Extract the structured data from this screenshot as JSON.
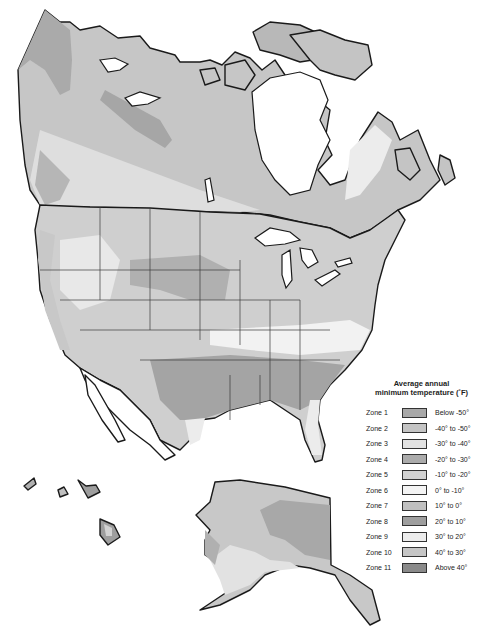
{
  "map": {
    "subject": "Plant hardiness zones of North America",
    "regions_shown": [
      "Canada",
      "United States (contiguous)",
      "Alaska",
      "Hawaii",
      "Northern Mexico"
    ],
    "colors": {
      "zone1": "#a8a8a8",
      "zone2": "#c4c4c4",
      "zone3": "#e2e2e2",
      "zone4": "#ababab",
      "zone5": "#d2d2d2",
      "zone6": "#f2f2f2",
      "zone7": "#c0c0c0",
      "zone8": "#9e9e9e",
      "zone9": "#ececec",
      "zone10": "#c8c8c8",
      "zone11": "#8c8c8c",
      "water": "#ffffff",
      "outline": "#1a1a1a"
    }
  },
  "legend": {
    "title_line1": "Average annual",
    "title_line2": "minimum temperature (˚F)",
    "items": [
      {
        "zone": "Zone 1",
        "range": "Below -50°",
        "color": "#a8a8a8"
      },
      {
        "zone": "Zone 2",
        "range": "-40° to -50°",
        "color": "#c4c4c4"
      },
      {
        "zone": "Zone 3",
        "range": "-30° to -40°",
        "color": "#e2e2e2"
      },
      {
        "zone": "Zone 4",
        "range": "-20° to -30°",
        "color": "#ababab"
      },
      {
        "zone": "Zone 5",
        "range": "-10° to -20°",
        "color": "#d2d2d2"
      },
      {
        "zone": "Zone 6",
        "range": "0° to -10°",
        "color": "#f4f4f4"
      },
      {
        "zone": "Zone 7",
        "range": "10° to 0°",
        "color": "#c0c0c0"
      },
      {
        "zone": "Zone 8",
        "range": "20° to 10°",
        "color": "#9e9e9e"
      },
      {
        "zone": "Zone 9",
        "range": "30° to 20°",
        "color": "#ececec"
      },
      {
        "zone": "Zone 10",
        "range": "40° to 30°",
        "color": "#c6c6c6"
      },
      {
        "zone": "Zone 11",
        "range": "Above 40°",
        "color": "#8a8a8a"
      }
    ]
  }
}
